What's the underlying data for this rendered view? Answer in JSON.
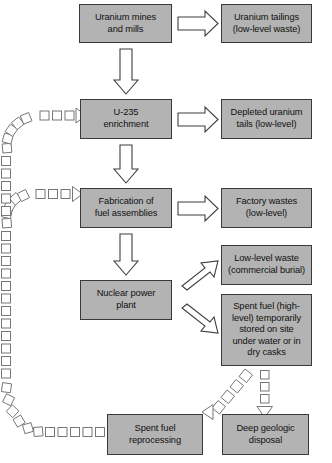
{
  "figure": {
    "kind": "flowchart",
    "title_text": "",
    "colors": {
      "box_fill": "#b3b3b3",
      "box_border": "#3a3a3a",
      "solid_arrow_stroke": "#3f3f3f",
      "solid_arrow_fill": "#ffffff",
      "dashed_arrow_stroke": "#777777",
      "background": "#ffffff",
      "text": "#111111"
    }
  },
  "nodes": [
    {
      "id": "uranium-mines-and-mills",
      "label": "Uranium mines\nand mills",
      "x": 79,
      "y": 4,
      "w": 93,
      "h": 39,
      "column": "left"
    },
    {
      "id": "uranium-tailings",
      "label": "Uranium tailings\n(low-level waste)",
      "x": 221,
      "y": 4,
      "w": 91,
      "h": 39,
      "column": "right"
    },
    {
      "id": "u-235-enrichment",
      "label": "U-235\nenrichment",
      "x": 80,
      "y": 99,
      "w": 92,
      "h": 40,
      "column": "left"
    },
    {
      "id": "depleted-uranium-tails",
      "label": "Depleted uranium\ntails (low-level)",
      "x": 221,
      "y": 99,
      "w": 91,
      "h": 40,
      "column": "right"
    },
    {
      "id": "fabrication-of-fuel-assemblies",
      "label": "Fabrication of\nfuel assemblies",
      "x": 80,
      "y": 188,
      "w": 92,
      "h": 40,
      "column": "left"
    },
    {
      "id": "factory-wastes",
      "label": "Factory wastes\n(low-level)",
      "x": 221,
      "y": 188,
      "w": 91,
      "h": 40,
      "column": "right"
    },
    {
      "id": "nuclear-power-plant",
      "label": "Nuclear power\nplant",
      "x": 80,
      "y": 280,
      "w": 92,
      "h": 40,
      "column": "left"
    },
    {
      "id": "low-level-waste-commercial-burial",
      "label": "Low-level waste\n(commercial burial)",
      "x": 221,
      "y": 245,
      "w": 91,
      "h": 40,
      "column": "right"
    },
    {
      "id": "spent-fuel-temporary-storage",
      "label": "Spent fuel (high-\nlevel) temporarily\nstored on site\nunder water or in\ndry casks",
      "x": 221,
      "y": 294,
      "w": 91,
      "h": 72,
      "column": "right"
    },
    {
      "id": "spent-fuel-reprocessing",
      "label": "Spent fuel\nreprocessing",
      "x": 107,
      "y": 414,
      "w": 96,
      "h": 41,
      "column": "left"
    },
    {
      "id": "deep-geologic-disposal",
      "label": "Deep geologic\ndisposal",
      "x": 222,
      "y": 414,
      "w": 87,
      "h": 41,
      "column": "right"
    }
  ],
  "connections": [
    {
      "id": "mines-to-tailings",
      "style": "solid",
      "direction": "right",
      "from": "uranium-mines-and-mills",
      "to": "uranium-tailings"
    },
    {
      "id": "mines-to-enrichment",
      "style": "solid",
      "direction": "down",
      "from": "uranium-mines-and-mills",
      "to": "u-235-enrichment"
    },
    {
      "id": "enrichment-to-depleted-tails",
      "style": "solid",
      "direction": "right",
      "from": "u-235-enrichment",
      "to": "depleted-uranium-tails"
    },
    {
      "id": "enrichment-to-fabrication",
      "style": "solid",
      "direction": "down",
      "from": "u-235-enrichment",
      "to": "fabrication-of-fuel-assemblies"
    },
    {
      "id": "fabrication-to-factory-wastes",
      "style": "solid",
      "direction": "right",
      "from": "fabrication-of-fuel-assemblies",
      "to": "factory-wastes"
    },
    {
      "id": "fabrication-to-power-plant",
      "style": "solid",
      "direction": "down",
      "from": "fabrication-of-fuel-assemblies",
      "to": "nuclear-power-plant"
    },
    {
      "id": "power-plant-to-low-level-waste",
      "style": "solid",
      "direction": "up-right",
      "from": "nuclear-power-plant",
      "to": "low-level-waste-commercial-burial"
    },
    {
      "id": "power-plant-to-spent-fuel",
      "style": "solid",
      "direction": "down-right",
      "from": "nuclear-power-plant",
      "to": "spent-fuel-temporary-storage"
    },
    {
      "id": "spent-fuel-to-deep-disposal",
      "style": "dashed",
      "direction": "down",
      "from": "spent-fuel-temporary-storage",
      "to": "deep-geologic-disposal"
    },
    {
      "id": "spent-fuel-to-reprocessing",
      "style": "dashed",
      "direction": "down-left",
      "from": "spent-fuel-temporary-storage",
      "to": "spent-fuel-reprocessing"
    },
    {
      "id": "reprocessing-to-enrichment",
      "style": "dashed",
      "direction": "left-up-right",
      "from": "spent-fuel-reprocessing",
      "to": "u-235-enrichment"
    },
    {
      "id": "reprocessing-to-fabrication",
      "style": "dashed",
      "direction": "left-up-right",
      "from": "spent-fuel-reprocessing",
      "to": "fabrication-of-fuel-assemblies"
    }
  ]
}
